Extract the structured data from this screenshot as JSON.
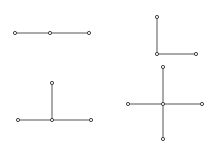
{
  "colors": {
    "line": "#555555",
    "node": "#444444",
    "background": "#ffffff"
  },
  "figures": [
    {
      "name": "straight-line-graph",
      "nodes": [
        [
          15,
          33
        ],
        [
          50,
          33
        ],
        [
          89,
          33
        ]
      ],
      "edges": [
        [
          0,
          1
        ],
        [
          1,
          2
        ]
      ]
    },
    {
      "name": "l-shape-graph",
      "nodes": [
        [
          157,
          17
        ],
        [
          157,
          54
        ],
        [
          196,
          54
        ]
      ],
      "edges": [
        [
          0,
          1
        ],
        [
          1,
          2
        ]
      ]
    },
    {
      "name": "t-shape-graph",
      "nodes": [
        [
          52,
          83
        ],
        [
          52,
          120
        ],
        [
          18,
          120
        ],
        [
          91,
          120
        ]
      ],
      "edges": [
        [
          0,
          1
        ],
        [
          2,
          1
        ],
        [
          1,
          3
        ]
      ]
    },
    {
      "name": "cross-shape-graph",
      "nodes": [
        [
          163,
          104
        ],
        [
          128,
          104
        ],
        [
          202,
          104
        ],
        [
          163,
          67
        ],
        [
          163,
          139
        ]
      ],
      "edges": [
        [
          1,
          0
        ],
        [
          0,
          2
        ],
        [
          3,
          0
        ],
        [
          0,
          4
        ]
      ]
    }
  ]
}
